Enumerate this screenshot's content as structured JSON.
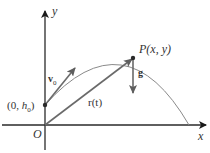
{
  "diagram": {
    "colors": {
      "axis": "#2a2a2a",
      "curve": "#888888",
      "vector": "#6a6a6a",
      "text": "#333333",
      "background": "#ffffff"
    },
    "axes": {
      "x_label": "x",
      "y_label": "y",
      "origin_label": "O"
    },
    "points": {
      "start": {
        "label_prefix": "(0, ",
        "label_var": "h",
        "label_sub": "0",
        "label_suffix": ")"
      },
      "P": {
        "label": "P(x, y)"
      }
    },
    "vectors": {
      "initial_velocity": {
        "symbol": "v",
        "subscript": "0"
      },
      "position": {
        "label": "r(t)"
      },
      "gravity": {
        "label": "g"
      }
    }
  }
}
